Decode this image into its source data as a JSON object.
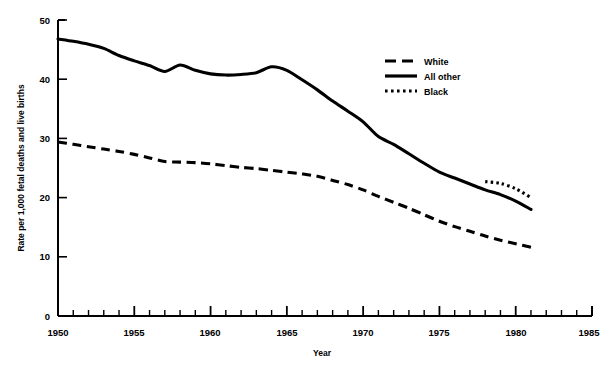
{
  "chart_data": {
    "type": "line",
    "title": "",
    "xlabel": "Year",
    "ylabel": "Rate per 1,000 fetal deaths and live births",
    "xlim": [
      1950,
      1985
    ],
    "ylim": [
      0,
      50
    ],
    "grid": false,
    "legend_position": "upper-right",
    "x_ticks_major": [
      1950,
      1955,
      1960,
      1965,
      1970,
      1975,
      1980,
      1985
    ],
    "x_tick_labels": [
      "1950",
      "1955",
      "1960",
      "1965",
      "1970",
      "1975",
      "1980",
      "1985"
    ],
    "x_minor_tick_step": 1,
    "y_ticks": [
      0,
      10,
      20,
      30,
      40,
      50
    ],
    "y_tick_labels": [
      "0",
      "10",
      "20",
      "30",
      "40",
      "50"
    ],
    "series": [
      {
        "name": "White",
        "style": "dashed",
        "color": "#000000",
        "x": [
          1950,
          1951,
          1952,
          1953,
          1954,
          1955,
          1956,
          1957,
          1958,
          1959,
          1960,
          1961,
          1962,
          1963,
          1964,
          1965,
          1966,
          1967,
          1968,
          1969,
          1970,
          1971,
          1972,
          1973,
          1974,
          1975,
          1976,
          1977,
          1978,
          1979,
          1980,
          1981
        ],
        "values": [
          29.4,
          29.0,
          28.6,
          28.2,
          27.8,
          27.3,
          26.7,
          26.1,
          26.0,
          25.9,
          25.7,
          25.4,
          25.1,
          24.9,
          24.6,
          24.3,
          24.0,
          23.6,
          22.9,
          22.2,
          21.3,
          20.2,
          19.2,
          18.2,
          17.1,
          16.0,
          15.1,
          14.3,
          13.5,
          12.8,
          12.2,
          11.6
        ]
      },
      {
        "name": "All other",
        "style": "solid",
        "color": "#000000",
        "x": [
          1950,
          1951,
          1952,
          1953,
          1954,
          1955,
          1956,
          1957,
          1958,
          1959,
          1960,
          1961,
          1962,
          1963,
          1964,
          1965,
          1966,
          1967,
          1968,
          1969,
          1970,
          1971,
          1972,
          1973,
          1974,
          1975,
          1976,
          1977,
          1978,
          1979,
          1980,
          1981
        ],
        "values": [
          46.8,
          46.4,
          45.9,
          45.2,
          44.0,
          43.1,
          42.3,
          41.3,
          42.4,
          41.5,
          40.9,
          40.7,
          40.8,
          41.1,
          42.1,
          41.5,
          39.9,
          38.2,
          36.3,
          34.6,
          32.8,
          30.3,
          29.0,
          27.4,
          25.8,
          24.3,
          23.3,
          22.3,
          21.3,
          20.5,
          19.4,
          18.0
        ]
      },
      {
        "name": "Black",
        "style": "dotted",
        "color": "#000000",
        "x": [
          1978,
          1979,
          1980,
          1981
        ],
        "values": [
          22.7,
          22.4,
          21.5,
          20.0
        ]
      }
    ]
  },
  "legend": {
    "items": [
      {
        "label": "White",
        "style": "dashed"
      },
      {
        "label": "All other",
        "style": "solid"
      },
      {
        "label": "Black",
        "style": "dotted"
      }
    ]
  },
  "axes": {
    "x_title": "Year",
    "y_title": "Rate per 1,000 fetal deaths and live births"
  }
}
